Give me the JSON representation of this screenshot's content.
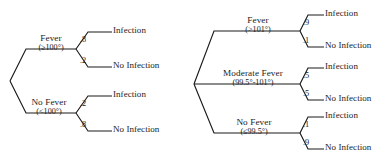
{
  "figure": {
    "kind": "probability-tree-diagram",
    "count": 2,
    "line_color": "#1b1b1b",
    "background_color": "#ffffff"
  },
  "trees": [
    {
      "id": "left-tree",
      "root_label": "",
      "branches": [
        {
          "name": "Fever",
          "range": "(≥100°)",
          "outcomes": [
            {
              "probability": ".8",
              "label": "Infection"
            },
            {
              "probability": ".2",
              "label": "No Infection"
            }
          ]
        },
        {
          "name": "No Fever",
          "range": "(<100°)",
          "outcomes": [
            {
              "probability": ".2",
              "label": "Infection"
            },
            {
              "probability": ".8",
              "label": "No Infection"
            }
          ]
        }
      ]
    },
    {
      "id": "right-tree",
      "root_label": "",
      "branches": [
        {
          "name": "Fever",
          "range": "(>101°)",
          "outcomes": [
            {
              "probability": ".9",
              "label": "Infection"
            },
            {
              "probability": ".1",
              "label": "No Infection"
            }
          ]
        },
        {
          "name": "Moderate Fever",
          "range": "(99.5°-101°)",
          "outcomes": [
            {
              "probability": ".5",
              "label": "Infection"
            },
            {
              "probability": ".5",
              "label": "No Infection"
            }
          ]
        },
        {
          "name": "No Fever",
          "range": "(≤99.5°)",
          "outcomes": [
            {
              "probability": ".1",
              "label": "Infection"
            },
            {
              "probability": ".9",
              "label": "No Infection"
            }
          ]
        }
      ]
    }
  ]
}
